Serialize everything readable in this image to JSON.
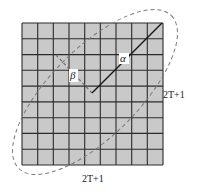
{
  "diagram": {
    "grid": {
      "rows": 9,
      "cols": 9,
      "fill": "#c8c8c8",
      "line": "#2a2a2a"
    },
    "labels": {
      "alpha": "α",
      "beta": "β",
      "side_right": "2T+1",
      "side_bottom": "2T+1"
    },
    "colors": {
      "dashed": "#777777",
      "solid": "#1a1a1a"
    }
  }
}
